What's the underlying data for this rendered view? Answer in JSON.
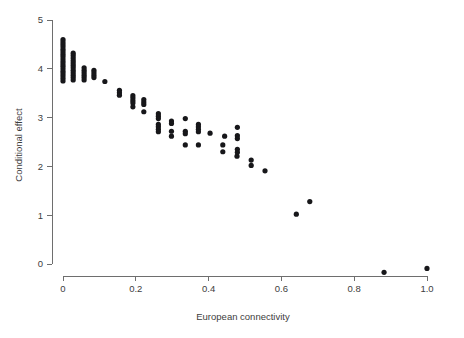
{
  "chart_data": {
    "type": "scatter",
    "title": "",
    "xlabel": "European connectivity",
    "ylabel": "Conditional effect",
    "xlim": [
      -0.03,
      1.04
    ],
    "ylim": [
      -0.35,
      5.25
    ],
    "xticks": [
      0,
      0.2,
      0.4,
      0.6,
      0.8,
      1.0
    ],
    "xticklabels": [
      "0",
      "0.2",
      "0.4",
      "0.6",
      "0.8",
      "1.0"
    ],
    "yticks": [
      0,
      1,
      2,
      3,
      4,
      5
    ],
    "yticklabels": [
      "0",
      "1",
      "2",
      "3",
      "4",
      "5"
    ],
    "grid": false,
    "legend": null,
    "marker": "circle",
    "marker_color": "#17171a",
    "points": [
      [
        0.0,
        4.6
      ],
      [
        0.0,
        4.55
      ],
      [
        0.0,
        4.5
      ],
      [
        0.0,
        4.45
      ],
      [
        0.0,
        4.4
      ],
      [
        0.0,
        4.35
      ],
      [
        0.0,
        4.3
      ],
      [
        0.0,
        4.25
      ],
      [
        0.0,
        4.2
      ],
      [
        0.0,
        4.15
      ],
      [
        0.0,
        4.1
      ],
      [
        0.0,
        4.05
      ],
      [
        0.0,
        4.0
      ],
      [
        0.0,
        3.95
      ],
      [
        0.0,
        3.9
      ],
      [
        0.0,
        3.85
      ],
      [
        0.0,
        3.8
      ],
      [
        0.0,
        3.75
      ],
      [
        0.028,
        4.32
      ],
      [
        0.028,
        4.27
      ],
      [
        0.028,
        4.22
      ],
      [
        0.028,
        4.17
      ],
      [
        0.028,
        4.12
      ],
      [
        0.028,
        4.07
      ],
      [
        0.028,
        4.02
      ],
      [
        0.028,
        3.97
      ],
      [
        0.028,
        3.92
      ],
      [
        0.028,
        3.87
      ],
      [
        0.028,
        3.82
      ],
      [
        0.028,
        3.77
      ],
      [
        0.058,
        4.02
      ],
      [
        0.058,
        3.97
      ],
      [
        0.058,
        3.92
      ],
      [
        0.058,
        3.87
      ],
      [
        0.058,
        3.82
      ],
      [
        0.058,
        3.77
      ],
      [
        0.085,
        3.97
      ],
      [
        0.085,
        3.92
      ],
      [
        0.085,
        3.87
      ],
      [
        0.085,
        3.82
      ],
      [
        0.115,
        3.74
      ],
      [
        0.155,
        3.56
      ],
      [
        0.155,
        3.51
      ],
      [
        0.155,
        3.46
      ],
      [
        0.192,
        3.45
      ],
      [
        0.192,
        3.4
      ],
      [
        0.192,
        3.35
      ],
      [
        0.192,
        3.3
      ],
      [
        0.192,
        3.22
      ],
      [
        0.222,
        3.37
      ],
      [
        0.222,
        3.32
      ],
      [
        0.222,
        3.27
      ],
      [
        0.222,
        3.12
      ],
      [
        0.262,
        3.08
      ],
      [
        0.262,
        3.03
      ],
      [
        0.262,
        2.98
      ],
      [
        0.262,
        2.86
      ],
      [
        0.262,
        2.81
      ],
      [
        0.262,
        2.76
      ],
      [
        0.262,
        2.71
      ],
      [
        0.298,
        2.93
      ],
      [
        0.298,
        2.88
      ],
      [
        0.298,
        2.72
      ],
      [
        0.298,
        2.62
      ],
      [
        0.336,
        2.98
      ],
      [
        0.336,
        2.72
      ],
      [
        0.336,
        2.67
      ],
      [
        0.336,
        2.44
      ],
      [
        0.372,
        2.86
      ],
      [
        0.372,
        2.81
      ],
      [
        0.372,
        2.76
      ],
      [
        0.372,
        2.71
      ],
      [
        0.372,
        2.44
      ],
      [
        0.404,
        2.68
      ],
      [
        0.439,
        2.44
      ],
      [
        0.439,
        2.3
      ],
      [
        0.444,
        2.62
      ],
      [
        0.478,
        2.21
      ],
      [
        0.479,
        2.8
      ],
      [
        0.479,
        2.63
      ],
      [
        0.479,
        2.57
      ],
      [
        0.479,
        2.35
      ],
      [
        0.479,
        2.29
      ],
      [
        0.517,
        2.13
      ],
      [
        0.517,
        2.02
      ],
      [
        0.555,
        1.91
      ],
      [
        0.641,
        1.02
      ],
      [
        0.678,
        1.28
      ],
      [
        0.882,
        -0.17
      ],
      [
        1.0,
        -0.09
      ]
    ]
  },
  "axes": {
    "x_axis_name": "x-axis",
    "y_axis_name": "y-axis"
  }
}
